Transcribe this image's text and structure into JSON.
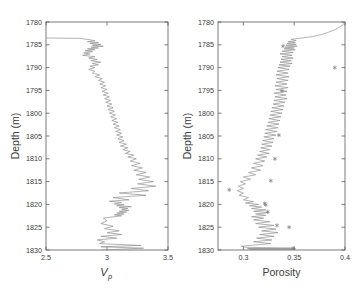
{
  "figure": {
    "width": 357,
    "height": 295,
    "background": "#ffffff",
    "line_color": "#8a8a8a",
    "axis_color": "#5a5a5a",
    "text_color": "#3a3a3a"
  },
  "chart_data": [
    {
      "type": "line",
      "panel": "left",
      "title": "",
      "xlabel": "Vp",
      "xlabel_main": "V",
      "xlabel_sub": "p",
      "ylabel": "Depth (m)",
      "xlim": [
        2.5,
        3.5
      ],
      "ylim": [
        1830,
        1780
      ],
      "y_inverted": true,
      "grid": false,
      "legend": "none",
      "xticks": [
        2.5,
        3,
        3.5
      ],
      "xticklabels": [
        "2.5",
        "3",
        "3.5"
      ],
      "yticks": [
        1780,
        1785,
        1790,
        1795,
        1800,
        1805,
        1810,
        1815,
        1820,
        1825,
        1830
      ],
      "yticklabels": [
        "1780",
        "1785",
        "1790",
        "1795",
        "1800",
        "1805",
        "1810",
        "1815",
        "1820",
        "1825",
        "1830"
      ],
      "series": [
        {
          "name": "Vp log",
          "x": [
            2.5,
            2.78,
            2.86,
            2.9,
            2.84,
            2.93,
            2.86,
            2.95,
            2.88,
            2.97,
            2.87,
            2.93,
            2.84,
            2.9,
            2.82,
            2.88,
            2.81,
            2.86,
            2.8,
            2.9,
            2.85,
            2.92,
            2.87,
            2.95,
            2.88,
            2.93,
            2.86,
            2.9,
            2.85,
            2.9,
            2.88,
            2.94,
            2.9,
            2.96,
            2.93,
            2.98,
            2.94,
            2.99,
            2.95,
            3.0,
            2.96,
            3.01,
            2.97,
            3.02,
            2.98,
            3.03,
            2.99,
            3.04,
            3.0,
            3.05,
            3.01,
            3.06,
            3.02,
            3.07,
            3.03,
            3.08,
            3.04,
            3.09,
            3.05,
            3.1,
            3.06,
            3.11,
            3.07,
            3.12,
            3.08,
            3.13,
            3.09,
            3.14,
            3.1,
            3.16,
            3.11,
            3.17,
            3.13,
            3.19,
            3.15,
            3.22,
            3.17,
            3.24,
            3.19,
            3.27,
            3.2,
            3.29,
            3.22,
            3.32,
            3.24,
            3.35,
            3.26,
            3.38,
            3.25,
            3.4,
            3.2,
            3.34,
            3.1,
            3.32,
            3.05,
            3.18,
            3.02,
            3.12,
            3.06,
            3.14,
            3.08,
            3.2,
            3.1,
            3.17,
            3.12,
            3.18,
            3.1,
            3.16,
            3.08,
            3.14,
            3.06,
            3.12,
            2.97,
            3.0,
            2.95,
            3.05,
            2.98,
            3.1,
            3.0,
            3.12,
            2.95,
            3.08,
            2.92,
            2.98,
            2.94,
            3.28,
            2.95,
            3.3,
            2.96
          ],
          "depth": [
            1783.5,
            1783.6,
            1783.9,
            1784.1,
            1784.3,
            1784.5,
            1784.7,
            1784.9,
            1785.1,
            1785.3,
            1785.5,
            1785.7,
            1785.9,
            1786.1,
            1786.3,
            1786.5,
            1786.8,
            1787.0,
            1787.3,
            1787.6,
            1787.9,
            1788.2,
            1788.5,
            1788.8,
            1789.1,
            1789.4,
            1789.7,
            1790.0,
            1790.4,
            1790.8,
            1791.2,
            1791.6,
            1792.0,
            1792.4,
            1792.8,
            1793.2,
            1793.6,
            1794.0,
            1794.4,
            1794.8,
            1795.2,
            1795.6,
            1796.0,
            1796.4,
            1796.8,
            1797.2,
            1797.6,
            1798.0,
            1798.4,
            1798.8,
            1799.2,
            1799.6,
            1800.0,
            1800.4,
            1800.8,
            1801.2,
            1801.6,
            1802.0,
            1802.4,
            1802.8,
            1803.2,
            1803.6,
            1804.0,
            1804.4,
            1804.8,
            1805.2,
            1805.6,
            1806.0,
            1806.4,
            1806.8,
            1807.2,
            1807.6,
            1808.0,
            1808.4,
            1808.8,
            1809.2,
            1809.6,
            1810.0,
            1810.5,
            1811.0,
            1811.5,
            1812.0,
            1812.5,
            1813.0,
            1813.5,
            1814.0,
            1814.5,
            1815.0,
            1815.5,
            1816.0,
            1816.5,
            1817.0,
            1817.5,
            1818.0,
            1818.5,
            1819.0,
            1819.3,
            1819.6,
            1819.9,
            1820.1,
            1820.3,
            1820.5,
            1820.7,
            1820.9,
            1821.1,
            1821.3,
            1821.5,
            1821.7,
            1821.9,
            1822.1,
            1822.3,
            1822.5,
            1823.0,
            1823.6,
            1824.2,
            1824.8,
            1825.3,
            1825.8,
            1826.2,
            1826.6,
            1827.0,
            1827.4,
            1827.8,
            1828.2,
            1828.6,
            1829.0,
            1829.3,
            1829.6,
            1830.0
          ]
        }
      ],
      "markers": []
    },
    {
      "type": "line",
      "panel": "right",
      "title": "",
      "xlabel": "Porosity",
      "ylabel": "Depth (m)",
      "xlim": [
        0.275,
        0.4
      ],
      "ylim": [
        1830,
        1780
      ],
      "y_inverted": true,
      "grid": false,
      "legend": "none",
      "xticks": [
        0.3,
        0.35,
        0.4
      ],
      "xticklabels": [
        "0.3",
        "0.35",
        "0.4"
      ],
      "yticks": [
        1780,
        1785,
        1790,
        1795,
        1800,
        1805,
        1810,
        1815,
        1820,
        1825,
        1830
      ],
      "yticklabels": [
        "1780",
        "1785",
        "1790",
        "1795",
        "1800",
        "1805",
        "1810",
        "1815",
        "1820",
        "1825",
        "1830"
      ],
      "series": [
        {
          "name": "Porosity log",
          "x": [
            0.4,
            0.398,
            0.394,
            0.389,
            0.383,
            0.376,
            0.368,
            0.358,
            0.347,
            0.352,
            0.344,
            0.351,
            0.343,
            0.352,
            0.342,
            0.353,
            0.341,
            0.35,
            0.34,
            0.351,
            0.338,
            0.349,
            0.336,
            0.348,
            0.338,
            0.349,
            0.337,
            0.347,
            0.336,
            0.348,
            0.335,
            0.346,
            0.334,
            0.345,
            0.333,
            0.344,
            0.332,
            0.345,
            0.333,
            0.344,
            0.332,
            0.343,
            0.331,
            0.344,
            0.332,
            0.343,
            0.33,
            0.342,
            0.331,
            0.343,
            0.33,
            0.341,
            0.329,
            0.34,
            0.328,
            0.339,
            0.327,
            0.338,
            0.326,
            0.337,
            0.325,
            0.336,
            0.324,
            0.335,
            0.323,
            0.334,
            0.322,
            0.333,
            0.321,
            0.332,
            0.32,
            0.33,
            0.319,
            0.329,
            0.318,
            0.328,
            0.317,
            0.326,
            0.316,
            0.325,
            0.314,
            0.323,
            0.312,
            0.321,
            0.31,
            0.319,
            0.308,
            0.317,
            0.305,
            0.312,
            0.3,
            0.307,
            0.297,
            0.302,
            0.295,
            0.3,
            0.294,
            0.3,
            0.296,
            0.305,
            0.3,
            0.31,
            0.302,
            0.315,
            0.306,
            0.318,
            0.308,
            0.322,
            0.31,
            0.325,
            0.312,
            0.322,
            0.308,
            0.32,
            0.31,
            0.326,
            0.312,
            0.33,
            0.315,
            0.332,
            0.318,
            0.334,
            0.316,
            0.33,
            0.313,
            0.328,
            0.31,
            0.327,
            0.306,
            0.298,
            0.302,
            0.348,
            0.304,
            0.35,
            0.306,
            0.349,
            0.35
          ],
          "depth": [
            1780.0,
            1780.6,
            1781.2,
            1781.8,
            1782.3,
            1782.8,
            1783.2,
            1783.5,
            1783.8,
            1784.1,
            1784.3,
            1784.5,
            1784.7,
            1784.9,
            1785.1,
            1785.3,
            1785.5,
            1785.7,
            1785.9,
            1786.1,
            1786.4,
            1786.7,
            1787.0,
            1787.3,
            1787.6,
            1787.9,
            1788.2,
            1788.5,
            1788.8,
            1789.1,
            1789.4,
            1789.7,
            1790.0,
            1790.4,
            1790.8,
            1791.2,
            1791.6,
            1792.0,
            1792.4,
            1792.8,
            1793.2,
            1793.6,
            1794.0,
            1794.4,
            1794.8,
            1795.2,
            1795.6,
            1796.0,
            1796.4,
            1796.8,
            1797.2,
            1797.6,
            1798.0,
            1798.4,
            1798.8,
            1799.2,
            1799.6,
            1800.0,
            1800.4,
            1800.8,
            1801.2,
            1801.6,
            1802.0,
            1802.4,
            1802.8,
            1803.2,
            1803.6,
            1804.0,
            1804.4,
            1804.8,
            1805.2,
            1805.6,
            1806.0,
            1806.4,
            1806.8,
            1807.2,
            1807.6,
            1808.0,
            1808.4,
            1808.8,
            1809.2,
            1809.6,
            1810.0,
            1810.5,
            1811.0,
            1811.5,
            1812.0,
            1812.5,
            1813.0,
            1813.5,
            1814.0,
            1814.5,
            1815.0,
            1815.5,
            1816.0,
            1816.5,
            1817.0,
            1817.5,
            1818.0,
            1818.5,
            1819.0,
            1819.4,
            1819.7,
            1820.0,
            1820.3,
            1820.6,
            1820.9,
            1821.2,
            1821.5,
            1821.8,
            1822.1,
            1822.4,
            1822.7,
            1823.0,
            1823.4,
            1823.8,
            1824.2,
            1824.6,
            1825.0,
            1825.4,
            1825.8,
            1826.2,
            1826.6,
            1827.0,
            1827.4,
            1827.8,
            1828.2,
            1828.6,
            1829.0,
            1829.2,
            1829.4,
            1829.6,
            1829.7,
            1829.8,
            1829.9,
            1830.0
          ]
        }
      ],
      "markers": {
        "symbol": "asterisk",
        "points": [
          {
            "x": 0.339,
            "depth": 1785.3
          },
          {
            "x": 0.39,
            "depth": 1790.0
          },
          {
            "x": 0.338,
            "depth": 1795.1
          },
          {
            "x": 0.335,
            "depth": 1804.8
          },
          {
            "x": 0.331,
            "depth": 1810.0
          },
          {
            "x": 0.327,
            "depth": 1814.8
          },
          {
            "x": 0.286,
            "depth": 1816.8
          },
          {
            "x": 0.321,
            "depth": 1819.8
          },
          {
            "x": 0.322,
            "depth": 1820.1
          },
          {
            "x": 0.324,
            "depth": 1821.6
          },
          {
            "x": 0.333,
            "depth": 1824.6
          },
          {
            "x": 0.345,
            "depth": 1825.0
          },
          {
            "x": 0.349,
            "depth": 1829.6
          },
          {
            "x": 0.35,
            "depth": 1829.9
          }
        ]
      }
    }
  ]
}
